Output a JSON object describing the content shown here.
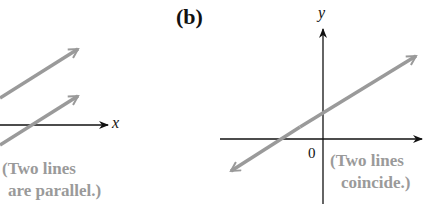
{
  "panel_a": {
    "x_axis_label": "x",
    "note_line1": "(Two lines",
    "note_line2": "are parallel.)"
  },
  "panel_b": {
    "label": "(b)",
    "y_axis_label": "y",
    "origin_label": "0",
    "note_line1": "(Two lines",
    "note_line2": "coincide.)"
  },
  "colors": {
    "axis": "#111111",
    "line": "#9a9a9a"
  }
}
